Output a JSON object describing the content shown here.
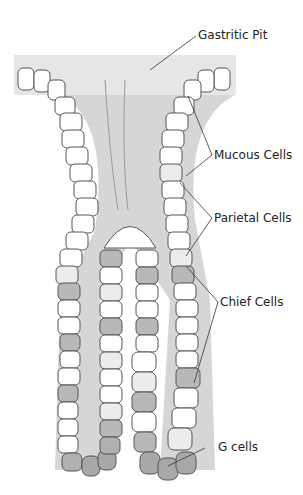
{
  "figure": {
    "labels": {
      "gastric_pit": "Gastritic Pit",
      "mucous": "Mucous Cells",
      "parietal": "Parietal Cells",
      "chief": "Chief Cells",
      "g_cells": "G cells"
    },
    "colors": {
      "lumen": "#d6d6d6",
      "mucous_cell": "#ffffff",
      "parietal_cell": "#ececec",
      "chief_cell": "#b8b8b8",
      "g_cell": "#a8a8a8",
      "outline": "#555555",
      "nucleus": "#444444"
    }
  }
}
